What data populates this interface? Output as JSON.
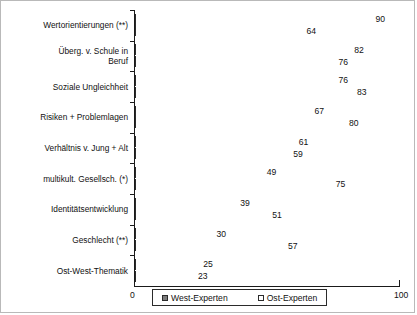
{
  "chart_data": {
    "type": "bar",
    "orientation": "horizontal",
    "title": "",
    "xlabel": "",
    "ylabel": "",
    "xlim": [
      0,
      100
    ],
    "grid": false,
    "legend_position": "bottom",
    "axis_ticks": [
      "0",
      "100"
    ],
    "categories": [
      "Wertorientierungen (**)",
      "Überg. v. Schule in\nBeruf",
      "Soziale Ungleichheit",
      "Risiken + Problemlagen",
      "Verhältnis v. Jung + Alt",
      "multikult. Gesellsch. (*)",
      "Identitätsentwicklung",
      "Geschlecht (**)",
      "Ost-West-Thematik"
    ],
    "series": [
      {
        "name": "Ost-Experten",
        "color": "#ffffff",
        "values": [
          90,
          82,
          76,
          67,
          61,
          49,
          39,
          30,
          25
        ]
      },
      {
        "name": "West-Experten",
        "color": "#c6c6c6",
        "values": [
          64,
          76,
          83,
          80,
          59,
          75,
          51,
          57,
          23
        ]
      }
    ]
  },
  "legend": {
    "entries": [
      {
        "label": "West-Experten",
        "swatch": "west"
      },
      {
        "label": "Ost-Experten",
        "swatch": "ost"
      }
    ]
  },
  "axis": {
    "min_label": "0",
    "max_label": "100"
  }
}
